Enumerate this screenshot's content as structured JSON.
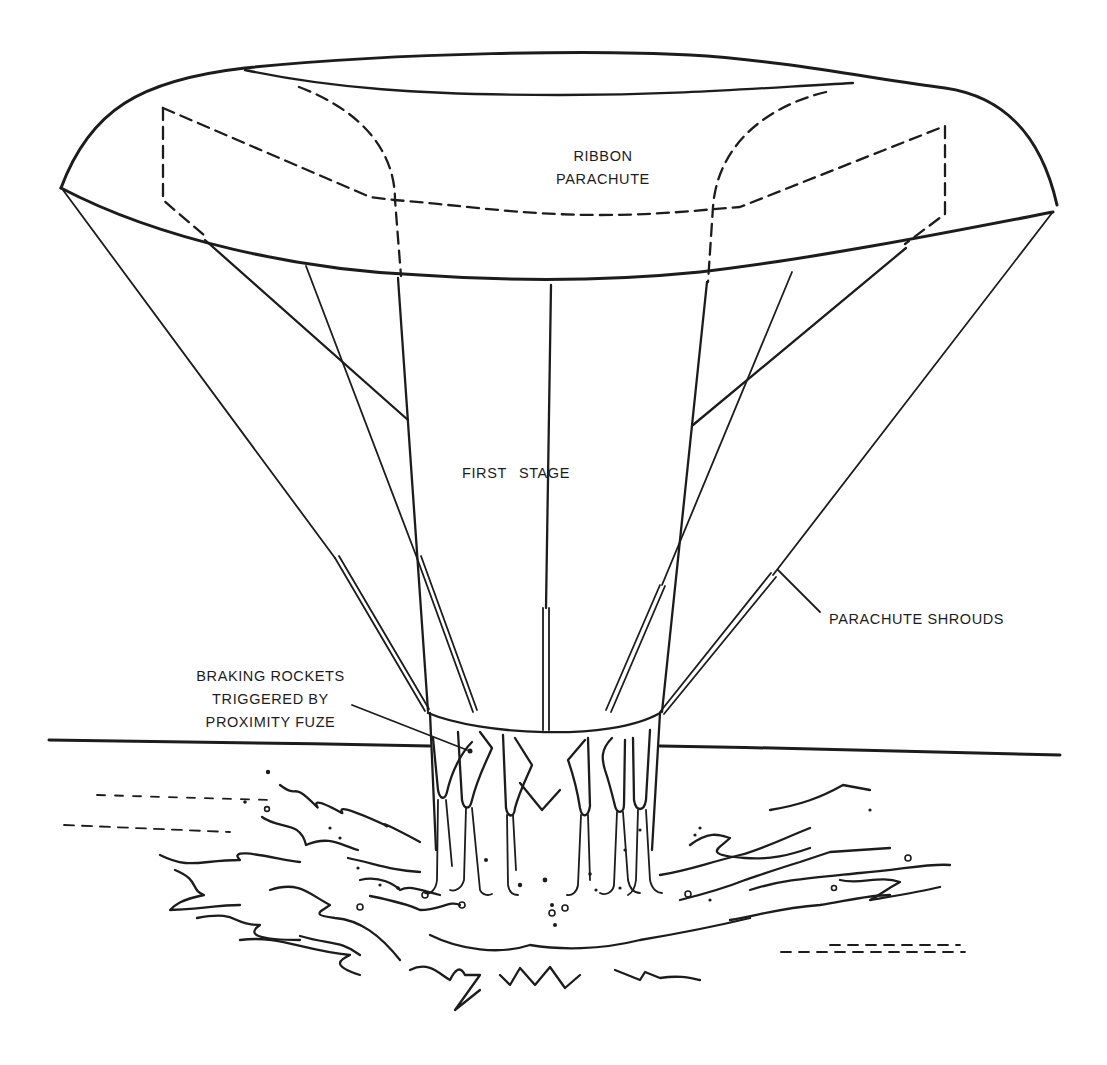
{
  "figure": {
    "labels": {
      "ribbon_parachute": [
        "RIBBON",
        "PARACHUTE"
      ],
      "first_stage": [
        "FIRST",
        "STAGE"
      ],
      "parachute_shrouds": "PARACHUTE SHROUDS",
      "braking_rockets": [
        "BRAKING ROCKETS",
        "TRIGGERED BY",
        "PROXIMITY FUZE"
      ]
    },
    "colors": {
      "ink": "#1c1c1c",
      "paper": "#ffffff"
    },
    "elements": [
      "ribbon-parachute-canopy",
      "canopy-dashed-gores",
      "parachute-shroud-lines",
      "first-stage-body",
      "braking-rocket-nozzles",
      "horizon-line",
      "water-splash"
    ]
  }
}
